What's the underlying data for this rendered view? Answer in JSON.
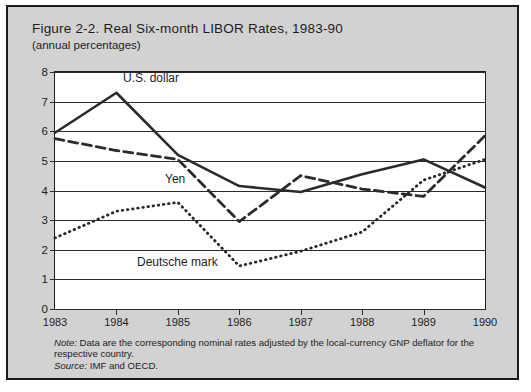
{
  "figure": {
    "title": "Figure 2-2.  Real Six-month LIBOR Rates, 1983-90",
    "subtitle": "(annual percentages)",
    "note_label": "Note:",
    "note_text": " Data are the corresponding nominal rates adjusted by the local-currency GNP deflator for the respective country.",
    "source_label": "Source:",
    "source_text": " IMF and OECD."
  },
  "colors": {
    "background": "#d2d2d2",
    "plot_background": "#ffffff",
    "border": "#1a1a1a",
    "line": "#2b2b2b",
    "text": "#1d1d1d"
  },
  "annotations": {
    "us_dollar": "U.S. dollar",
    "yen": "Yen",
    "deutsche_mark": "Deutsche mark"
  },
  "chart_data": {
    "type": "line",
    "title": "Figure 2-2.  Real Six-month LIBOR Rates, 1983-90",
    "subtitle": "(annual percentages)",
    "xlabel": "",
    "ylabel": "",
    "xlim": [
      1983,
      1990
    ],
    "ylim": [
      0,
      8
    ],
    "ytick_labels": [
      "0",
      "1",
      "2",
      "3",
      "4",
      "5",
      "6",
      "7",
      "8"
    ],
    "ytick_values": [
      0,
      1,
      2,
      3,
      4,
      5,
      6,
      7,
      8
    ],
    "categories": [
      "1983",
      "1984",
      "1985",
      "1986",
      "1987",
      "1988",
      "1989",
      "1990"
    ],
    "x": [
      1983,
      1984,
      1985,
      1986,
      1987,
      1988,
      1989,
      1990
    ],
    "grid": true,
    "legend": "inline-annotations",
    "series": [
      {
        "name": "U.S. dollar",
        "style": "solid",
        "values": [
          5.95,
          7.3,
          5.2,
          4.15,
          3.95,
          4.55,
          5.05,
          4.1
        ]
      },
      {
        "name": "Yen",
        "style": "dashed",
        "values": [
          5.75,
          5.35,
          5.05,
          2.95,
          4.5,
          4.05,
          3.8,
          5.85
        ]
      },
      {
        "name": "Deutsche mark",
        "style": "dotted",
        "values": [
          2.4,
          3.3,
          3.6,
          1.45,
          1.95,
          2.6,
          4.35,
          5.05
        ]
      }
    ]
  }
}
